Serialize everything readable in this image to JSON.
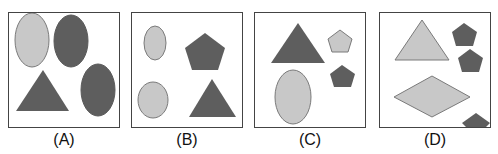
{
  "colors": {
    "light": "#c8c8c8",
    "dark": "#5e5e5e",
    "stroke": "#7a7a7a"
  },
  "panels": [
    {
      "label": "(A)",
      "shapes": [
        "light-ellipse",
        "dark-ellipse",
        "dark-triangle",
        "dark-ellipse"
      ]
    },
    {
      "label": "(B)",
      "shapes": [
        "light-ellipse",
        "dark-pentagon",
        "light-ellipse",
        "dark-triangle"
      ]
    },
    {
      "label": "(C)",
      "shapes": [
        "dark-triangle",
        "light-pentagon",
        "dark-pentagon",
        "light-ellipse"
      ]
    },
    {
      "label": "(D)",
      "shapes": [
        "light-triangle",
        "dark-pentagon",
        "dark-pentagon",
        "light-diamond",
        "dark-pentagon"
      ]
    }
  ]
}
